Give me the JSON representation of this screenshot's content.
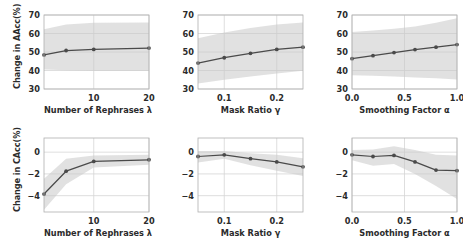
{
  "figure": {
    "rows": 2,
    "cols": 3,
    "background": "#ffffff",
    "line_color": "#4a4a4a",
    "band_color": "#c8c8c8",
    "grid_color": "#d6d6d6",
    "spine_color": "#b0b0b0",
    "text_color": "#2b2b2b"
  },
  "chart_data": [
    {
      "type": "line",
      "panel": "top-left",
      "title": "",
      "xlabel": "Number of Rephrases λ",
      "ylabel": "Change in AAcc(%)",
      "xlim": [
        1,
        20
      ],
      "ylim": [
        30,
        70
      ],
      "xticks": [
        10,
        20
      ],
      "xticklabels": [
        "10",
        "20"
      ],
      "yticks": [
        30,
        40,
        50,
        60,
        70
      ],
      "yticklabels": [
        "30",
        "40",
        "50",
        "60",
        "70"
      ],
      "grid": true,
      "legend": "none",
      "x": [
        1,
        5,
        10,
        20
      ],
      "values": [
        48.4,
        50.8,
        51.4,
        52.1
      ],
      "band_lower": [
        40.5,
        40.1,
        39.9,
        39.8
      ],
      "band_upper": [
        62.3,
        64.8,
        65.8,
        66.0
      ]
    },
    {
      "type": "line",
      "panel": "top-center",
      "title": "",
      "xlabel": "Mask Ratio γ",
      "ylabel": "",
      "xlim": [
        0.05,
        0.25
      ],
      "ylim": [
        30,
        70
      ],
      "xticks": [
        0.1,
        0.2
      ],
      "xticklabels": [
        "0.1",
        "0.2"
      ],
      "yticks": [
        30,
        40,
        50,
        60,
        70
      ],
      "yticklabels": [
        "30",
        "40",
        "50",
        "60",
        "70"
      ],
      "grid": true,
      "legend": "none",
      "x": [
        0.05,
        0.1,
        0.15,
        0.2,
        0.25
      ],
      "values": [
        44.0,
        46.9,
        49.3,
        51.4,
        52.6
      ],
      "band_lower": [
        33.0,
        35.0,
        36.8,
        38.4,
        39.8
      ],
      "band_upper": [
        57.5,
        60.6,
        63.0,
        64.8,
        66.0
      ]
    },
    {
      "type": "line",
      "panel": "top-right",
      "title": "",
      "xlabel": "Smoothing Factor α",
      "ylabel": "",
      "xlim": [
        0.0,
        1.0
      ],
      "ylim": [
        30,
        70
      ],
      "xticks": [
        0.0,
        0.5,
        1.0
      ],
      "xticklabels": [
        "0.0",
        "0.5",
        "1.0"
      ],
      "yticks": [
        30,
        40,
        50,
        60,
        70
      ],
      "yticklabels": [
        "30",
        "40",
        "50",
        "60",
        "70"
      ],
      "grid": true,
      "legend": "none",
      "x": [
        0.0,
        0.2,
        0.4,
        0.6,
        0.8,
        1.0
      ],
      "values": [
        46.4,
        48.0,
        49.7,
        51.3,
        52.6,
        54.0
      ],
      "band_lower": [
        37.5,
        37.1,
        36.7,
        36.2,
        35.8,
        35.2
      ],
      "band_upper": [
        60.8,
        61.6,
        62.6,
        63.8,
        65.8,
        68.2
      ]
    },
    {
      "type": "line",
      "panel": "bottom-left",
      "title": "",
      "xlabel": "Number of Rephrases λ",
      "ylabel": "Change in CAcc(%)",
      "xlim": [
        1,
        20
      ],
      "ylim": [
        -5.5,
        1.3
      ],
      "xticks": [
        10,
        20
      ],
      "xticklabels": [
        "10",
        "20"
      ],
      "yticks": [
        0,
        -2,
        -4
      ],
      "yticklabels": [
        "0",
        "−2",
        "−4"
      ],
      "grid": true,
      "legend": "none",
      "x": [
        1,
        5,
        10,
        20
      ],
      "values": [
        -3.85,
        -1.75,
        -0.85,
        -0.7
      ],
      "band_lower": [
        -5.3,
        -2.95,
        -1.4,
        -1.15
      ],
      "band_upper": [
        -2.45,
        -0.6,
        -0.3,
        -0.25
      ]
    },
    {
      "type": "line",
      "panel": "bottom-center",
      "title": "",
      "xlabel": "Mask Ratio γ",
      "ylabel": "",
      "xlim": [
        0.05,
        0.25
      ],
      "ylim": [
        -5.5,
        1.3
      ],
      "xticks": [
        0.1,
        0.2
      ],
      "xticklabels": [
        "0.1",
        "0.2"
      ],
      "yticks": [
        0,
        -2,
        -4
      ],
      "yticklabels": [
        "0",
        "−2",
        "−4"
      ],
      "grid": true,
      "legend": "none",
      "x": [
        0.05,
        0.1,
        0.15,
        0.2,
        0.25
      ],
      "values": [
        -0.4,
        -0.25,
        -0.6,
        -0.9,
        -1.35
      ],
      "band_lower": [
        -0.95,
        -0.6,
        -1.2,
        -1.7,
        -2.2
      ],
      "band_upper": [
        0.1,
        0.1,
        -0.1,
        -0.25,
        -0.55
      ]
    },
    {
      "type": "line",
      "panel": "bottom-right",
      "title": "",
      "xlabel": "Smoothing Factor α",
      "ylabel": "",
      "xlim": [
        0.0,
        1.0
      ],
      "ylim": [
        -5.5,
        1.3
      ],
      "xticks": [
        0.0,
        0.5,
        1.0
      ],
      "xticklabels": [
        "0.0",
        "0.5",
        "1.0"
      ],
      "yticks": [
        0,
        -2,
        -4
      ],
      "yticklabels": [
        "0",
        "−2",
        "−4"
      ],
      "grid": true,
      "legend": "none",
      "x": [
        0.0,
        0.2,
        0.4,
        0.6,
        0.8,
        1.0
      ],
      "values": [
        -0.25,
        -0.4,
        -0.3,
        -0.9,
        -1.65,
        -1.7
      ],
      "band_lower": [
        -0.75,
        -1.25,
        -1.1,
        -2.0,
        -3.1,
        -4.3
      ],
      "band_upper": [
        0.2,
        0.25,
        0.55,
        0.2,
        -0.25,
        -0.3
      ]
    }
  ]
}
